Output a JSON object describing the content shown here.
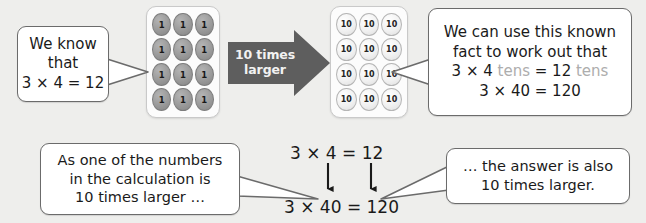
{
  "background_color": "#eeeeec",
  "callouts": {
    "we_know": {
      "name": "we-know-that-callout",
      "lines": [
        "We know",
        "that",
        "3 × 4 = 12"
      ]
    },
    "known_fact": {
      "name": "known-fact-callout",
      "line1": "We can use this known",
      "line2": "fact to work out that",
      "line3_a": "3 × 4 ",
      "line3_tens1": "tens",
      "line3_b": " = 12 ",
      "line3_tens2": "tens",
      "line4": "3 × 40 = 120"
    },
    "as_one_number": {
      "name": "as-one-of-the-numbers-callout",
      "lines": [
        "As one of the numbers",
        "in the calculation is",
        "10 times larger …"
      ]
    },
    "answer_also": {
      "name": "the-answer-is-also-callout",
      "lines": [
        "… the answer is also",
        "10 times larger."
      ]
    }
  },
  "block_arrow": {
    "name": "ten-times-larger-arrow",
    "line1": "10 times",
    "line2": "larger",
    "fill_color": "#5e5e5e",
    "text_color": "#f2f2f2"
  },
  "panels": {
    "ones": {
      "name": "ones-counter-panel",
      "rows": 4,
      "cols": 3,
      "counter_label": "1",
      "total": 12,
      "chip_style": "dark-grey"
    },
    "tens": {
      "name": "tens-counter-panel",
      "rows": 4,
      "cols": 3,
      "counter_label": "10",
      "total": 120,
      "chip_style": "light-grey"
    }
  },
  "equations": {
    "top": "3 × 4 = 12",
    "bottom": "3 × 40 = 120"
  },
  "colors": {
    "tens_word": "#adadad",
    "bubble_border": "#6b6b6b",
    "arrow_stroke": "#222222"
  }
}
